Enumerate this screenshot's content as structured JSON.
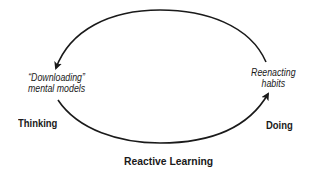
{
  "diagram": {
    "title": "Reactive Learning",
    "left_node": {
      "line1": "“Downloading”",
      "line2": "mental models",
      "category": "Thinking"
    },
    "right_node": {
      "line1": "Reenacting",
      "line2": "habits",
      "category": "Doing"
    },
    "edges": [
      {
        "from": "Reenacting habits",
        "to": "“Downloading” mental models",
        "path": "top-arc",
        "arrow": "arrow-at-left"
      },
      {
        "from": "“Downloading” mental models",
        "to": "Reenacting habits",
        "path": "bottom-arc",
        "arrow": "arrow-at-right"
      }
    ],
    "colors": {
      "stroke": "#1a1a1a",
      "background": "#ffffff"
    }
  }
}
